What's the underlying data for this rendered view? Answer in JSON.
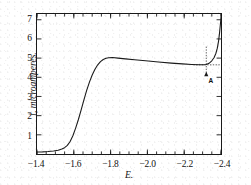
{
  "figure": {
    "background_color": "#ffffff",
    "line_color": "#1a1a1a",
    "axis_color": "#1a1a1a"
  },
  "axis_titles": {
    "x": "E.",
    "y": "i, microamperes."
  },
  "annotation": {
    "label": "A",
    "x": -2.32,
    "y_top": 4.65,
    "y_bottom": 4.12,
    "style": "dotted-vertical-with-arrow"
  },
  "chart_data": {
    "type": "line",
    "title": "",
    "subtitle": "",
    "xlabel": "E.",
    "ylabel": "i, microamperes.",
    "xlim": [
      -1.4,
      -2.4
    ],
    "ylim": [
      0,
      7.3
    ],
    "x_ticks": [
      -1.4,
      -1.6,
      -1.8,
      -2.0,
      -2.2,
      -2.4
    ],
    "x_tick_labels": [
      "-1.4",
      "-1.6",
      "-1.8",
      "-2.0",
      "-2.2",
      "-2.4"
    ],
    "y_ticks": [
      1,
      2,
      3,
      4,
      5,
      6,
      7
    ],
    "y_tick_labels": [
      "1",
      "2",
      "3",
      "4",
      "5",
      "6",
      "7"
    ],
    "x_minor_tick_step": 0.05,
    "y_minor_ticks": [],
    "grid": false,
    "legend": null,
    "x_axis_direction": "decreasing",
    "series": [
      {
        "name": "polarographic wave",
        "x": [
          -1.4,
          -1.43,
          -1.46,
          -1.49,
          -1.515,
          -1.535,
          -1.55,
          -1.565,
          -1.58,
          -1.595,
          -1.61,
          -1.625,
          -1.64,
          -1.655,
          -1.67,
          -1.685,
          -1.7,
          -1.715,
          -1.73,
          -1.745,
          -1.76,
          -1.775,
          -1.79,
          -1.81,
          -1.84,
          -1.88,
          -1.93,
          -1.99,
          -2.06,
          -2.13,
          -2.19,
          -2.24,
          -2.28,
          -2.305,
          -2.32,
          -2.335,
          -2.35,
          -2.362,
          -2.372,
          -2.38,
          -2.387,
          -2.392,
          -2.396,
          -2.4
        ],
        "y": [
          0.1,
          0.11,
          0.13,
          0.16,
          0.2,
          0.26,
          0.33,
          0.45,
          0.65,
          0.95,
          1.35,
          1.8,
          2.3,
          2.82,
          3.32,
          3.75,
          4.12,
          4.42,
          4.65,
          4.82,
          4.93,
          4.99,
          5.02,
          5.03,
          5.0,
          4.96,
          4.91,
          4.86,
          4.8,
          4.74,
          4.7,
          4.67,
          4.65,
          4.65,
          4.67,
          4.73,
          4.86,
          5.02,
          5.24,
          5.52,
          5.9,
          6.3,
          6.7,
          7.1
        ]
      }
    ],
    "annotations": [
      {
        "text": "A",
        "x": -2.32,
        "y": 4.18,
        "marker": "arrow-up",
        "connector": "dotted"
      }
    ]
  }
}
